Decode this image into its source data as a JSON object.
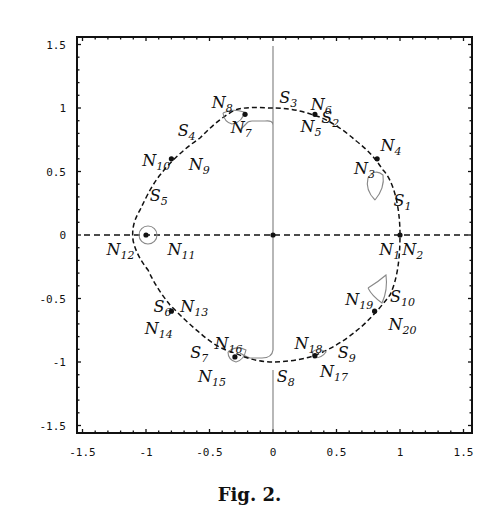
{
  "figure": {
    "caption": "Fig. 2."
  },
  "chart_data": {
    "type": "scatter",
    "title": "",
    "xlabel": "",
    "ylabel": "",
    "xlim": [
      -1.5,
      1.5
    ],
    "ylim": [
      -1.5,
      1.5
    ],
    "grid": false,
    "legend": null,
    "x_ticks": [
      "-1.5",
      "-1",
      "-0.5",
      "0",
      "0.5",
      "1",
      "1.5"
    ],
    "y_ticks": [
      "1.5",
      "1",
      "0.5",
      "0",
      "-0.5",
      "-1",
      "-1.5"
    ],
    "points": [
      {
        "label": "N",
        "sub": "1",
        "x": 0.92,
        "y": -0.12
      },
      {
        "label": "N",
        "sub": "2",
        "x": 1.1,
        "y": -0.12
      },
      {
        "label": "S",
        "sub": "1",
        "x": 1.02,
        "y": 0.27
      },
      {
        "label": "N",
        "sub": "3",
        "x": 0.72,
        "y": 0.52
      },
      {
        "label": "N",
        "sub": "4",
        "x": 0.93,
        "y": 0.7
      },
      {
        "label": "S",
        "sub": "2",
        "x": 0.45,
        "y": 0.92
      },
      {
        "label": "N",
        "sub": "5",
        "x": 0.3,
        "y": 0.85
      },
      {
        "label": "N",
        "sub": "6",
        "x": 0.38,
        "y": 1.02
      },
      {
        "label": "S",
        "sub": "3",
        "x": 0.12,
        "y": 1.08
      },
      {
        "label": "N",
        "sub": "7",
        "x": -0.25,
        "y": 0.84
      },
      {
        "label": "N",
        "sub": "8",
        "x": -0.4,
        "y": 1.04
      },
      {
        "label": "S",
        "sub": "4",
        "x": -0.68,
        "y": 0.82
      },
      {
        "label": "N",
        "sub": "10",
        "x": -0.92,
        "y": 0.58
      },
      {
        "label": "N",
        "sub": "9",
        "x": -0.58,
        "y": 0.55
      },
      {
        "label": "S",
        "sub": "5",
        "x": -0.9,
        "y": 0.31
      },
      {
        "label": "N",
        "sub": "11",
        "x": -0.72,
        "y": -0.12
      },
      {
        "label": "N",
        "sub": "12",
        "x": -1.2,
        "y": -0.12
      },
      {
        "label": "S",
        "sub": "6",
        "x": -0.87,
        "y": -0.57
      },
      {
        "label": "N",
        "sub": "13",
        "x": -0.62,
        "y": -0.57
      },
      {
        "label": "N",
        "sub": "14",
        "x": -0.9,
        "y": -0.74
      },
      {
        "label": "S",
        "sub": "7",
        "x": -0.58,
        "y": -0.93
      },
      {
        "label": "N",
        "sub": "16",
        "x": -0.35,
        "y": -0.86
      },
      {
        "label": "N",
        "sub": "15",
        "x": -0.48,
        "y": -1.12
      },
      {
        "label": "S",
        "sub": "8",
        "x": 0.1,
        "y": -1.12
      },
      {
        "label": "N",
        "sub": "18",
        "x": 0.28,
        "y": -0.86
      },
      {
        "label": "N",
        "sub": "17",
        "x": 0.48,
        "y": -1.08
      },
      {
        "label": "S",
        "sub": "9",
        "x": 0.58,
        "y": -0.93
      },
      {
        "label": "N",
        "sub": "19",
        "x": 0.68,
        "y": -0.51
      },
      {
        "label": "N",
        "sub": "20",
        "x": 1.02,
        "y": -0.71
      },
      {
        "label": "S",
        "sub": "10",
        "x": 1.02,
        "y": -0.49
      }
    ],
    "equilibria_dots": [
      {
        "x": 0,
        "y": 0
      },
      {
        "x": 1,
        "y": 0
      },
      {
        "x": -1,
        "y": 0
      },
      {
        "x": 0.82,
        "y": 0.6
      },
      {
        "x": 0.33,
        "y": 0.95
      },
      {
        "x": -0.22,
        "y": 0.95
      },
      {
        "x": -0.8,
        "y": 0.6
      },
      {
        "x": -0.8,
        "y": -0.6
      },
      {
        "x": -0.3,
        "y": -0.96
      },
      {
        "x": 0.33,
        "y": -0.95
      },
      {
        "x": 0.8,
        "y": -0.6
      }
    ]
  }
}
